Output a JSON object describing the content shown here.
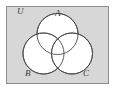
{
  "figure": {
    "name": "three-set-venn-diagram",
    "universe_label": "U",
    "set_labels": {
      "a": "A",
      "b": "B",
      "c": "C"
    },
    "colors": {
      "universe_fill": "#d7d7d7",
      "universe_stroke": "#8d8d8d",
      "circle_fill": "#ffffff",
      "circle_stroke": "#4a4a4a",
      "label_color": "#3a3a3a",
      "page_background": "#ffffff"
    },
    "geometry": {
      "rect": {
        "x": 6,
        "y": 6,
        "width": 103,
        "height": 78
      },
      "circle_a": {
        "cx": 57.5,
        "cy": 34,
        "r": 20.5
      },
      "circle_b": {
        "cx": 43.5,
        "cy": 53.5,
        "r": 20.5
      },
      "circle_c": {
        "cx": 72,
        "cy": 53.5,
        "r": 20.5
      },
      "label_positions": {
        "u": {
          "x": 17,
          "y": 14
        },
        "a": {
          "x": 55,
          "y": 16
        },
        "b": {
          "x": 27,
          "y": 75
        },
        "c": {
          "x": 84,
          "y": 75
        }
      }
    }
  }
}
